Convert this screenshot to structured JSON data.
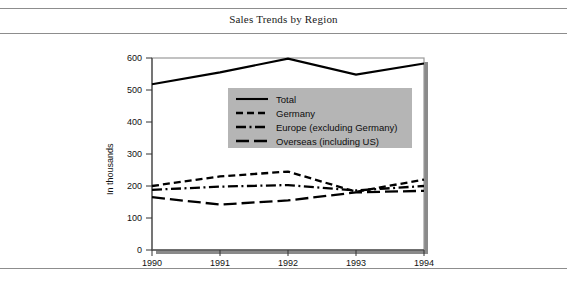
{
  "document": {
    "title": "Sales Trends by Region",
    "rules": [
      "top-rule",
      "title-rule",
      "bottom-rule"
    ]
  },
  "chart_data": {
    "type": "line",
    "title": "Sales Trends by Region",
    "xlabel": "",
    "ylabel": "In thousands",
    "categories": [
      "1990",
      "1991",
      "1992",
      "1993",
      "1994"
    ],
    "x": [
      1990,
      1991,
      1992,
      1993,
      1994
    ],
    "xlim": [
      1990,
      1994
    ],
    "ylim": [
      0,
      600
    ],
    "yticks": [
      0,
      100,
      200,
      300,
      400,
      500,
      600
    ],
    "xticks": [
      "1990",
      "1991",
      "1992",
      "1993",
      "1994"
    ],
    "grid": false,
    "legend_position": "center",
    "legend_background": "#b5b5b5",
    "series": [
      {
        "name": "Total",
        "style": "solid",
        "color": "#000000",
        "values": [
          518,
          555,
          598,
          548,
          583
        ]
      },
      {
        "name": "Germany",
        "style": "dashed",
        "color": "#000000",
        "values": [
          200,
          230,
          245,
          182,
          220
        ]
      },
      {
        "name": "Europe (excluding Germany)",
        "style": "dash-dot",
        "color": "#000000",
        "values": [
          188,
          198,
          203,
          186,
          200
        ]
      },
      {
        "name": "Overseas (including US)",
        "style": "long-dash",
        "color": "#000000",
        "values": [
          165,
          142,
          155,
          180,
          185
        ]
      }
    ]
  },
  "axes": {
    "y_tick_labels": [
      "600",
      "500",
      "400",
      "300",
      "200",
      "100",
      "0"
    ],
    "x_tick_labels": [
      "1990",
      "1991",
      "1992",
      "1993",
      "1994"
    ],
    "y_axis_title": "In thousands"
  },
  "legend": {
    "items": [
      {
        "label": "Total",
        "style": "solid"
      },
      {
        "label": "Germany",
        "style": "dashed"
      },
      {
        "label": "Europe (excluding Germany)",
        "style": "dash-dot"
      },
      {
        "label": "Overseas (including US)",
        "style": "long-dash"
      }
    ]
  },
  "colors": {
    "line": "#000000",
    "legend_panel": "#b5b5b5",
    "frame": "#9a9a9a",
    "shadow": "#8a8a8a",
    "rule": "#8d8d8d",
    "background": "#ffffff"
  }
}
